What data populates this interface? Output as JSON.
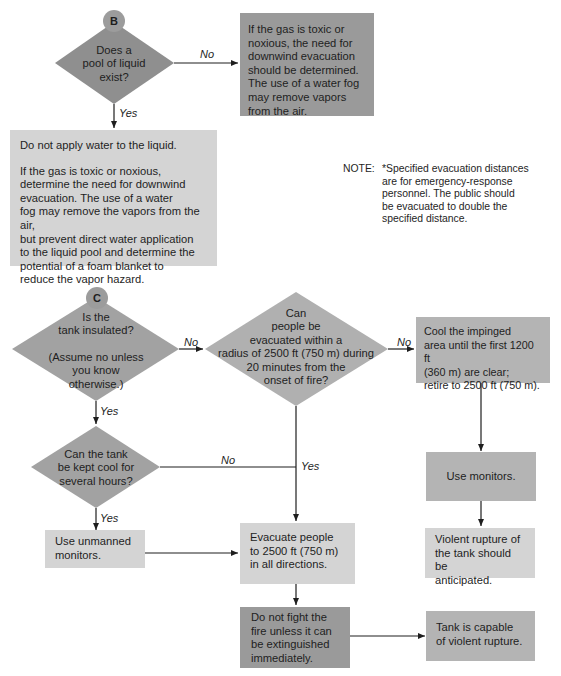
{
  "connectors": {
    "b": "B",
    "c": "C"
  },
  "section_b": {
    "decision": "Does a pool of liquid exist?",
    "decision_lines": [
      "Does a",
      "pool of liquid",
      "exist?"
    ],
    "no_label": "No",
    "yes_label": "Yes",
    "no_box_lines": [
      "If the gas is toxic or",
      "noxious, the need for",
      "downwind evacuation",
      "should be determined.",
      "The use of a water fog",
      "may remove vapors",
      "from the air."
    ],
    "yes_box": {
      "para1": "Do not apply water to the liquid.",
      "para2_lines": [
        "If the gas is toxic or noxious,",
        "determine the need for downwind",
        "evacuation. The use of a water",
        "fog may remove the vapors from the air,",
        "but prevent direct water application",
        "to the liquid pool and determine the",
        "potential of a foam blanket to",
        "reduce the vapor hazard."
      ]
    }
  },
  "note": {
    "label": "NOTE:",
    "lines": [
      "*Specified evacuation distances",
      "are for emergency-response",
      "personnel. The public should",
      "be evacuated to double the",
      "specified distance."
    ]
  },
  "section_c": {
    "insulated": {
      "lines": [
        "Is the",
        "tank insulated?",
        "",
        "(Assume no unless",
        "you know",
        "otherwise.)"
      ],
      "no_label": "No",
      "yes_label": "Yes"
    },
    "evacuate_question": {
      "lines": [
        "Can",
        "people be",
        "evacuated within a",
        "radius of 2500 ft (750 m) during",
        "20 minutes from the",
        "onset of fire?"
      ],
      "no_label": "No",
      "yes_label": "Yes"
    },
    "cool_box_lines": [
      "Cool the impinged",
      "area until the first 1200 ft",
      "(360 m) are clear;",
      "retire to 2500 ft (750 m)."
    ],
    "keep_cool": {
      "lines": [
        "Can the tank",
        "be kept cool for",
        "several hours?"
      ],
      "no_label": "No",
      "yes_label": "Yes"
    },
    "use_monitors": "Use monitors.",
    "violent_rupture_lines": [
      "Violent rupture of",
      "the tank should be",
      "anticipated."
    ],
    "unmanned_lines": [
      "Use unmanned",
      "monitors."
    ],
    "evacuate_box_lines": [
      "Evacuate people",
      "to 2500 ft (750 m)",
      "in all directions."
    ],
    "do_not_fight_lines": [
      "Do not fight the",
      "fire unless it can",
      "be extinguished",
      "immediately."
    ],
    "capable_lines": [
      "Tank is capable",
      "of violent rupture."
    ]
  },
  "colors": {
    "dark_fill": "#9a9a9a",
    "mid_fill": "#b4b4b4",
    "light_fill": "#d4d4d4",
    "line": "#1e1e1e"
  }
}
